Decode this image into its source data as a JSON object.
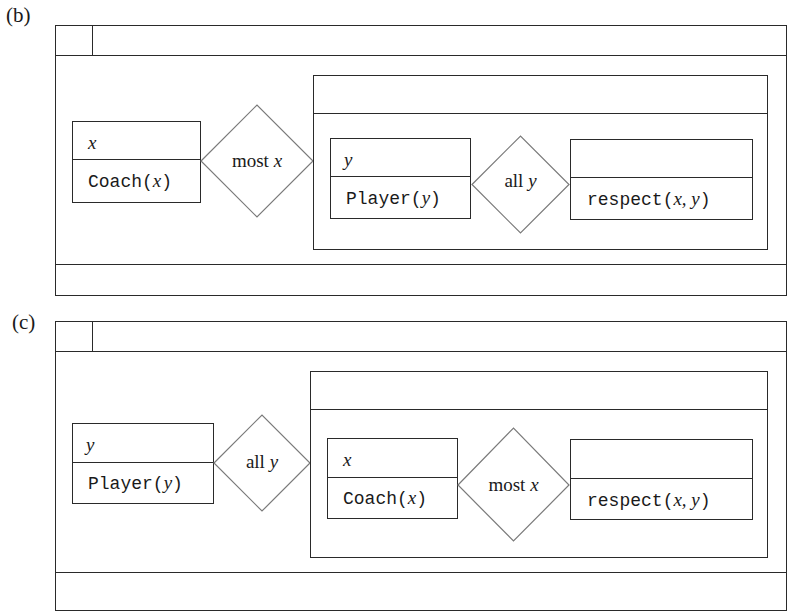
{
  "figure": {
    "panels": [
      {
        "id": "b",
        "label": "(b)",
        "outer_quantifier": {
          "referent": "x",
          "restrictor_condition_pred": "Coach",
          "restrictor_condition_args": "x",
          "quantifier_word": "most",
          "quantifier_var": "x"
        },
        "inner_quantifier": {
          "referent": "y",
          "restrictor_condition_pred": "Player",
          "restrictor_condition_args": "y",
          "quantifier_word": "all",
          "quantifier_var": "y"
        },
        "scope": {
          "referent": "",
          "condition_pred": "respect",
          "condition_args": "x, y"
        }
      },
      {
        "id": "c",
        "label": "(c)",
        "outer_quantifier": {
          "referent": "y",
          "restrictor_condition_pred": "Player",
          "restrictor_condition_args": "y",
          "quantifier_word": "all",
          "quantifier_var": "y"
        },
        "inner_quantifier": {
          "referent": "x",
          "restrictor_condition_pred": "Coach",
          "restrictor_condition_args": "x",
          "quantifier_word": "most",
          "quantifier_var": "x"
        },
        "scope": {
          "referent": "",
          "condition_pred": "respect",
          "condition_args": "x, y"
        }
      }
    ],
    "line_color": "#2a2a2a",
    "diamond_stroke_color": "#7a7a7a"
  }
}
